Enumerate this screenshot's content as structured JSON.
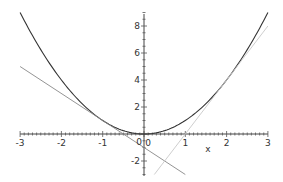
{
  "chart_data": {
    "type": "line",
    "title": "",
    "xlabel": "x",
    "ylabel": "",
    "xlim": [
      -3,
      3
    ],
    "ylim": [
      -3,
      9
    ],
    "grid": false,
    "x_ticks": [
      -3,
      -2,
      -1,
      0,
      1,
      2,
      3
    ],
    "x_tick_labels": [
      "-3",
      "-2",
      "-1",
      "0",
      "1",
      "2",
      "3"
    ],
    "y_ticks": [
      -2,
      2,
      4,
      6,
      8
    ],
    "y_tick_labels": [
      "-2",
      "2",
      "4",
      "6",
      "8"
    ],
    "origin_label": "0",
    "series": [
      {
        "name": "f(x) = x^2",
        "color": "#333333",
        "style": "solid",
        "x": [
          -3,
          -2.5,
          -2,
          -1.5,
          -1,
          -0.5,
          0,
          0.5,
          1,
          1.5,
          2,
          2.5,
          3
        ],
        "values": [
          9,
          6.25,
          4,
          2.25,
          1,
          0.25,
          0,
          0.25,
          1,
          2.25,
          4,
          6.25,
          9
        ]
      },
      {
        "name": "tangent at x=-1: y = -2x - 1",
        "color": "#888888",
        "style": "solid",
        "x": [
          -3,
          1
        ],
        "values": [
          5,
          -3
        ]
      },
      {
        "name": "tangent at x=2: y = 4x - 4",
        "color": "#c8c8c8",
        "style": "solid",
        "x": [
          0.25,
          3
        ],
        "values": [
          -3,
          8
        ]
      }
    ]
  }
}
